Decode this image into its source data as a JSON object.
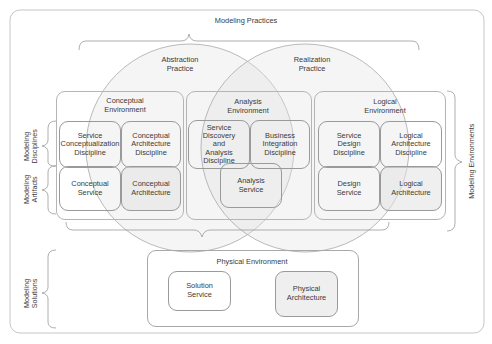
{
  "diagram": {
    "top_label": "Modeling Practices",
    "practices": [
      {
        "label": "Abstraction\nPractice"
      },
      {
        "label": "Realization\nPractice"
      }
    ],
    "environments": [
      {
        "label": "Conceptual\nEnvironment",
        "discipline_boxes": [
          {
            "label": "Service\nConceptualization\nDiscipline",
            "shaded": false
          },
          {
            "label": "Conceptual\nArchitecture\nDiscipline",
            "shaded": false
          }
        ],
        "artifact_boxes": [
          {
            "label": "Conceptual\nService",
            "shaded": false
          },
          {
            "label": "Conceptual\nArchitecture",
            "shaded": true
          }
        ]
      },
      {
        "label": "Analysis\nEnvironment",
        "discipline_boxes": [
          {
            "label": "Service\nDiscovery\nand\nAnalysis\nDiscipline",
            "shaded": false
          },
          {
            "label": "Business\nIntegration\nDiscipline",
            "shaded": false
          }
        ],
        "artifact_boxes": [
          {
            "label": "Analysis\nService",
            "shaded": false
          }
        ]
      },
      {
        "label": "Logical\nEnvironment",
        "discipline_boxes": [
          {
            "label": "Service\nDesign\nDiscipline",
            "shaded": false
          },
          {
            "label": "Logical\nArchitecture\nDiscipline",
            "shaded": false
          }
        ],
        "artifact_boxes": [
          {
            "label": "Design\nService",
            "shaded": false
          },
          {
            "label": "Logical\nArchitecture",
            "shaded": true
          }
        ]
      }
    ],
    "physical_environment": {
      "label": "Physical Environment",
      "boxes": [
        {
          "label": "Solution\nService",
          "shaded": false
        },
        {
          "label": "Physical\nArchitecture",
          "shaded": true
        }
      ]
    },
    "side_labels": {
      "disciplines": "Modeling\nDisciplines",
      "artifacts": "Modeling\nArtifacts",
      "solutions": "Modeling\nSolutions",
      "environments": "Modeling Environments"
    },
    "colors": {
      "line": "#9a9a9a",
      "shade": "#e2e2e2",
      "text": "#3a3a3a"
    }
  }
}
